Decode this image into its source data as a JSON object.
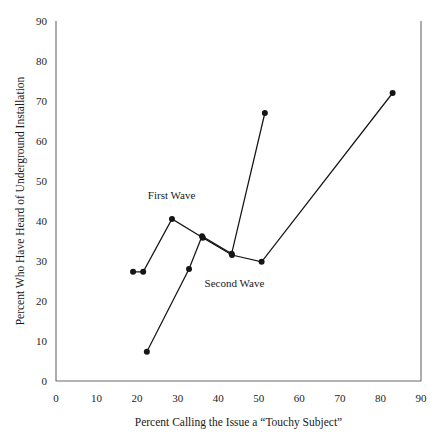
{
  "chart_data": {
    "type": "line",
    "title": "",
    "xlabel": "Percent Calling the Issue a “Touchy Subject”",
    "ylabel": "Percent Who Have Heard of Underground Installation",
    "xlim": [
      0,
      90
    ],
    "ylim": [
      0,
      90
    ],
    "xticks": [
      0,
      10,
      20,
      30,
      40,
      50,
      60,
      70,
      80,
      90
    ],
    "yticks": [
      0,
      10,
      20,
      30,
      40,
      50,
      60,
      70,
      80,
      90
    ],
    "xtick_labels": [
      "0",
      "10",
      "20",
      "30",
      "40",
      "50",
      "60",
      "70",
      "80",
      "90"
    ],
    "ytick_labels": [
      "0",
      "10",
      "20",
      "30",
      "40",
      "50",
      "60",
      "70",
      "80",
      "90"
    ],
    "grid": false,
    "legend_position": "inline-annotation",
    "marker": "filled-circle",
    "series": [
      {
        "name": "First Wave",
        "label": "First Wave",
        "label_x": 28.5,
        "label_y": 45.5,
        "points": [
          {
            "x": 19.0,
            "y": 27.3
          },
          {
            "x": 21.5,
            "y": 27.3
          },
          {
            "x": 28.6,
            "y": 40.5
          },
          {
            "x": 36.2,
            "y": 35.8
          },
          {
            "x": 43.4,
            "y": 31.5
          },
          {
            "x": 50.7,
            "y": 29.8
          },
          {
            "x": 83.0,
            "y": 72.0
          }
        ]
      },
      {
        "name": "Second Wave",
        "label": "Second Wave",
        "label_x": 44.0,
        "label_y": 23.5,
        "points": [
          {
            "x": 22.4,
            "y": 7.3
          },
          {
            "x": 32.8,
            "y": 28.0
          },
          {
            "x": 36.0,
            "y": 36.2
          },
          {
            "x": 43.3,
            "y": 31.8
          },
          {
            "x": 51.5,
            "y": 67.0
          }
        ]
      }
    ]
  }
}
